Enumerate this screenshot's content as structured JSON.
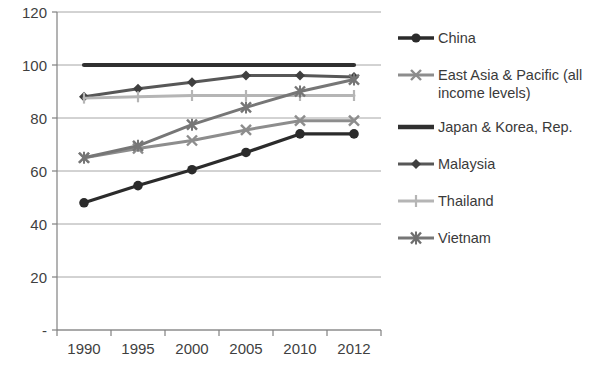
{
  "chart_data": {
    "type": "line",
    "title": "",
    "xlabel": "",
    "ylabel": "",
    "categories": [
      "1990",
      "1995",
      "2000",
      "2005",
      "2010",
      "2012"
    ],
    "ytick_labels": [
      "-",
      "20",
      "40",
      "60",
      "80",
      "100",
      "120"
    ],
    "ytick_values": [
      0,
      20,
      40,
      60,
      80,
      100,
      120
    ],
    "ylim": [
      0,
      120
    ],
    "grid": true,
    "legend_position": "right",
    "series": [
      {
        "name": "China",
        "marker": "circle",
        "color": "#2b2b2b",
        "width": 3.2,
        "values": [
          48,
          54.5,
          60.5,
          67,
          74,
          74
        ]
      },
      {
        "name": "East Asia & Pacific (all income levels)",
        "marker": "x",
        "color": "#8d8d8d",
        "width": 3.0,
        "values": [
          65,
          68.5,
          71.5,
          75.5,
          79,
          79
        ]
      },
      {
        "name": "Japan & Korea, Rep.",
        "marker": "none",
        "color": "#303030",
        "width": 4.2,
        "values": [
          100,
          100,
          100,
          100,
          100,
          100
        ]
      },
      {
        "name": "Malaysia",
        "marker": "diamond",
        "color": "#575757",
        "width": 3.0,
        "values": [
          88,
          91,
          93.5,
          96,
          96,
          95.5
        ]
      },
      {
        "name": "Thailand",
        "marker": "plus",
        "color": "#b5b5b5",
        "width": 3.0,
        "values": [
          87.5,
          88,
          88.5,
          88.5,
          88.5,
          88.5
        ]
      },
      {
        "name": "Vietnam",
        "marker": "asterisk",
        "color": "#767676",
        "width": 3.0,
        "values": [
          65,
          69.5,
          77.5,
          84,
          90,
          94.5
        ]
      }
    ]
  },
  "legend": {
    "items": [
      {
        "label": "China"
      },
      {
        "label": "East Asia & Pacific (all income levels)"
      },
      {
        "label": "Japan & Korea, Rep."
      },
      {
        "label": "Malaysia"
      },
      {
        "label": "Thailand"
      },
      {
        "label": "Vietnam"
      }
    ]
  },
  "colors": {
    "axis": "#808080",
    "grid": "#a6a6a6",
    "text": "#3a3a3a",
    "background": "#ffffff"
  }
}
